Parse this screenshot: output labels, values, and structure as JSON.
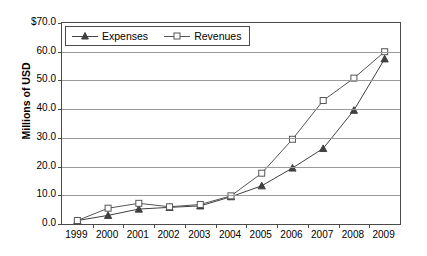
{
  "chart_data": {
    "type": "line",
    "title": "",
    "xlabel": "",
    "ylabel": "Millions of USD",
    "categories": [
      "1999",
      "2000",
      "2001",
      "2002",
      "2003",
      "2004",
      "2005",
      "2006",
      "2007",
      "2008",
      "2009"
    ],
    "ylim": [
      0,
      70
    ],
    "ytick_labels": [
      "$70.0",
      "60.0",
      "50.0",
      "40.0",
      "30.0",
      "20.0",
      "10.0",
      "0.0"
    ],
    "ytick_values": [
      70,
      60,
      50,
      40,
      30,
      20,
      10,
      0
    ],
    "grid": true,
    "legend_position": "top-left inside",
    "series": [
      {
        "name": "Expenses",
        "marker": "triangle",
        "color": "#404040",
        "values": [
          1.2,
          3.0,
          5.2,
          5.8,
          6.3,
          9.5,
          13.3,
          19.5,
          26.3,
          39.6,
          57.5
        ]
      },
      {
        "name": "Revenues",
        "marker": "square",
        "color": "#555555",
        "values": [
          1.2,
          5.5,
          7.2,
          6.0,
          6.8,
          9.8,
          17.7,
          29.5,
          43.0,
          50.8,
          60.0
        ]
      }
    ]
  },
  "legend": {
    "items": [
      {
        "label": "Expenses"
      },
      {
        "label": "Revenues"
      }
    ]
  },
  "colors": {
    "axis": "#4a4a4a",
    "grid": "#9a9a9a",
    "expenses": "#404040",
    "revenues": "#555555",
    "background": "#ffffff"
  }
}
